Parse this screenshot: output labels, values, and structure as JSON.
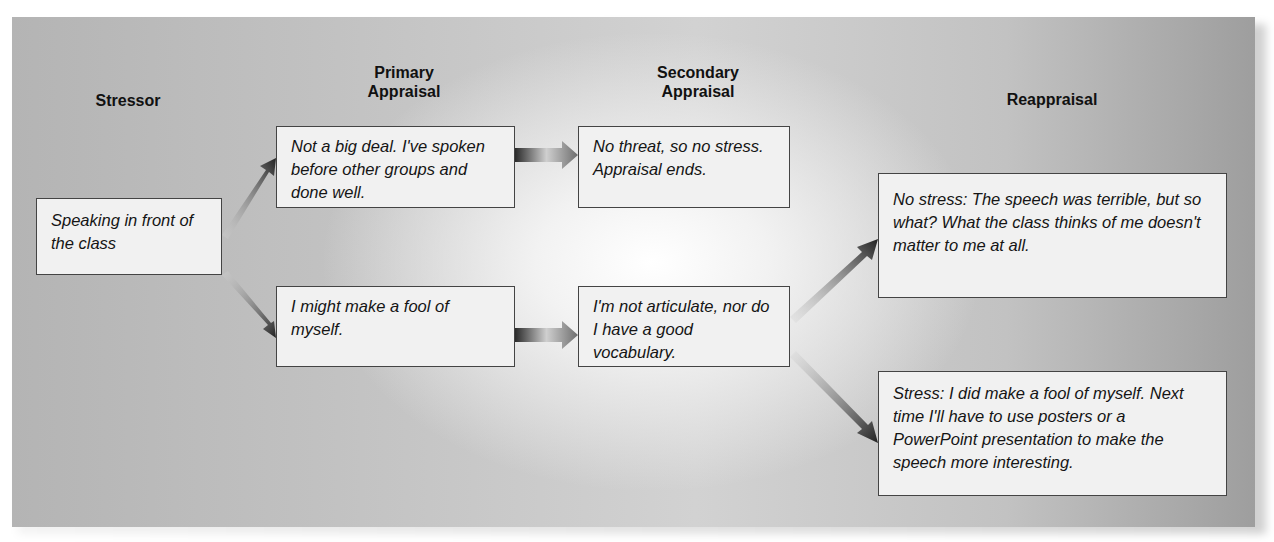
{
  "headings": {
    "stressor": "Stressor",
    "primary_line1": "Primary",
    "primary_line2": "Appraisal",
    "secondary_line1": "Secondary",
    "secondary_line2": "Appraisal",
    "reappraisal": "Reappraisal"
  },
  "boxes": {
    "stressor": "Speaking in front of the class",
    "primary_top": "Not a big deal. I've spoken before other groups and done well.",
    "primary_bottom": "I might make a fool of myself.",
    "secondary_top": "No threat, so no stress. Appraisal ends.",
    "secondary_bottom": "I'm not articulate, nor do I have a good vocabulary.",
    "reappraisal_top": "No stress: The speech was terrible, but so what? What the class thinks of me doesn't matter to me at all.",
    "reappraisal_bottom": "Stress: I did make a fool of myself. Next time I'll have to use posters or a PowerPoint presentation to make the speech more interesting."
  },
  "colors": {
    "box_fill": "#f1f1f1",
    "box_border": "#444444",
    "arrow_dark": "#2a2a2a"
  }
}
